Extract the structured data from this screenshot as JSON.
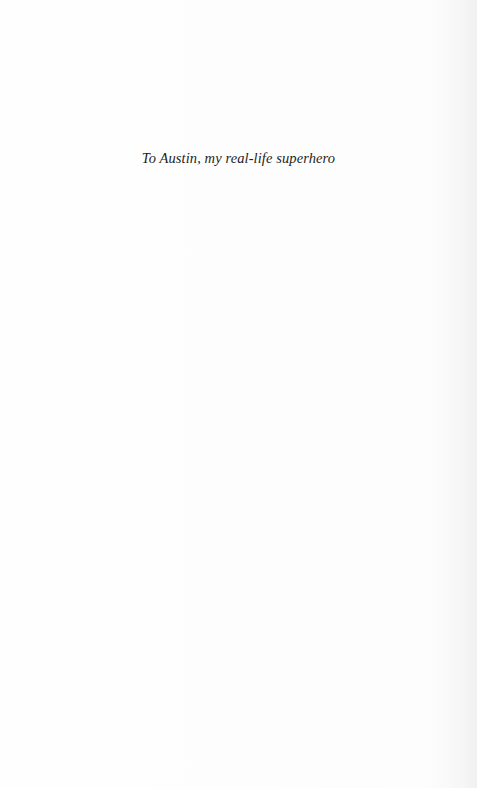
{
  "page": {
    "type": "dedication",
    "dedication_text": "To Austin, my real-life superhero"
  }
}
